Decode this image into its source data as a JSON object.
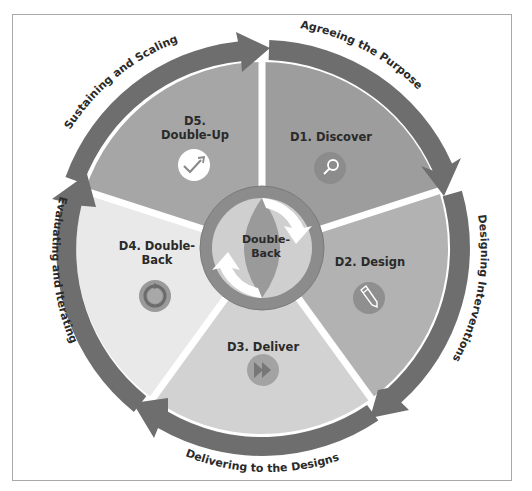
{
  "diagram": {
    "center": {
      "label_line1": "Double-",
      "label_line2": "Back",
      "ring_color": "#8c8c8c",
      "inner_color": "#9c9c9c"
    },
    "colors": {
      "arrow": "#6e6e6e",
      "frame": "#a8a8a8",
      "text": "#2a2a2a",
      "icon_circle": "#8f8f8f"
    },
    "stages": [
      {
        "id": "D1",
        "label_line1": "D1. Discover",
        "label_line2": "",
        "icon": "magnifier-icon",
        "fill": "#9d9d9d"
      },
      {
        "id": "D2",
        "label_line1": "D2. Design",
        "label_line2": "",
        "icon": "pencil-icon",
        "fill": "#b2b2b2"
      },
      {
        "id": "D3",
        "label_line1": "D3. Deliver",
        "label_line2": "",
        "icon": "fast-forward-icon",
        "fill": "#d2d2d2"
      },
      {
        "id": "D4",
        "label_line1": "D4. Double-",
        "label_line2": "Back",
        "icon": "refresh-icon",
        "fill": "#e9e9e9"
      },
      {
        "id": "D5",
        "label_line1": "D5.",
        "label_line2": "Double-Up",
        "icon": "check-arrow-icon",
        "fill": "#a6a6a6"
      }
    ],
    "arcs": [
      {
        "label": "Agreeing the Purpose"
      },
      {
        "label": "Designing Interventions"
      },
      {
        "label": "Delivering to the Designs"
      },
      {
        "label": "Evaluating and Iterating"
      },
      {
        "label": "Sustaining and Scaling"
      }
    ]
  }
}
